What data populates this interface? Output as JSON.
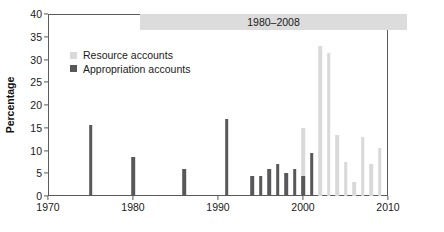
{
  "chart_data": {
    "type": "bar",
    "title": "",
    "banner_label": "1980–2008",
    "xlabel": "",
    "ylabel": "Percentage",
    "xlim": [
      1970,
      2010
    ],
    "ylim": [
      0,
      40
    ],
    "yticks": [
      0,
      5,
      10,
      15,
      20,
      25,
      30,
      35,
      40
    ],
    "xticks": [
      1970,
      1980,
      1990,
      2000,
      2010
    ],
    "grid": false,
    "legend_position": "upper-left-inside",
    "colors": {
      "appropriation_accounts": "#58585a",
      "resource_accounts": "#d9d9d9",
      "axis": "#5a5a5a",
      "banner": "#dcdcdc",
      "text": "#1a1a1a"
    },
    "series": [
      {
        "name": "Resource accounts",
        "color": "#d9d9d9",
        "points": [
          {
            "x": 2000,
            "y": 15.0
          },
          {
            "x": 2002,
            "y": 33.0
          },
          {
            "x": 2003,
            "y": 31.5
          },
          {
            "x": 2004,
            "y": 13.5
          },
          {
            "x": 2005,
            "y": 7.5
          },
          {
            "x": 2006,
            "y": 3.0
          },
          {
            "x": 2007,
            "y": 13.0
          },
          {
            "x": 2008,
            "y": 7.0
          },
          {
            "x": 2009,
            "y": 10.5
          }
        ]
      },
      {
        "name": "Appropriation accounts",
        "color": "#58585a",
        "points": [
          {
            "x": 1975,
            "y": 15.5
          },
          {
            "x": 1980,
            "y": 8.5
          },
          {
            "x": 1986,
            "y": 6.0
          },
          {
            "x": 1991,
            "y": 17.0
          },
          {
            "x": 1994,
            "y": 4.5
          },
          {
            "x": 1995,
            "y": 4.5
          },
          {
            "x": 1996,
            "y": 6.0
          },
          {
            "x": 1997,
            "y": 7.0
          },
          {
            "x": 1998,
            "y": 5.0
          },
          {
            "x": 1999,
            "y": 6.0
          },
          {
            "x": 2000,
            "y": 4.5
          },
          {
            "x": 2001,
            "y": 9.5
          }
        ]
      }
    ]
  },
  "legend": {
    "items": [
      {
        "label": "Resource accounts",
        "color": "#d9d9d9"
      },
      {
        "label": "Appropriation accounts",
        "color": "#58585a"
      }
    ]
  }
}
